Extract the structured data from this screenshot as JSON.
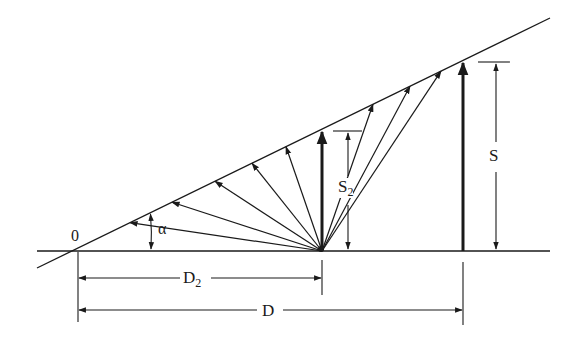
{
  "diagram": {
    "colors": {
      "ink": "#1a1a1a",
      "background": "#ffffff"
    },
    "labels": {
      "origin": "0",
      "angle": "α",
      "height_small": "S",
      "height_small_sub": "2",
      "height_large": "S",
      "distance_small": "D",
      "distance_small_sub": "2",
      "distance_large": "D"
    },
    "geometry": {
      "baseline": {
        "x1": 37,
        "y1": 251,
        "x2": 550,
        "y2": 251
      },
      "slope_line": {
        "x1": 37,
        "y1": 268,
        "x2": 550,
        "y2": 18
      },
      "origin_point": {
        "x": 78,
        "y": 251
      },
      "fan_point": {
        "x": 322,
        "y": 251
      },
      "fan_arrow_tips_x": [
        130,
        172,
        215,
        252,
        286,
        320,
        400,
        438,
        463
      ],
      "s2_marker_x": 322,
      "s_marker_x": 463,
      "s2_dimension_x": 348,
      "s_dimension_x": 496,
      "d2_dimension_y": 278,
      "d_dimension_y": 310
    }
  }
}
